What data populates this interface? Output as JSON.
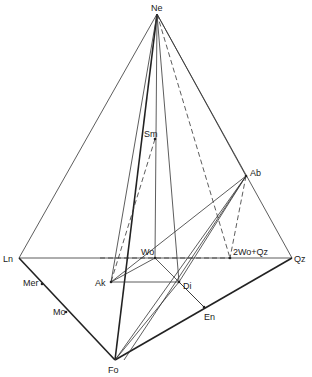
{
  "diagram": {
    "type": "tetrahedron-phase-diagram",
    "vertices": {
      "Ne": {
        "label": "Ne",
        "x": 157,
        "y": 14
      },
      "Ln": {
        "label": "Ln",
        "x": 19,
        "y": 258
      },
      "Qz": {
        "label": "Qz",
        "x": 292,
        "y": 258
      },
      "Fo": {
        "label": "Fo",
        "x": 115,
        "y": 360
      }
    },
    "points": {
      "Ab": {
        "label": "Ab",
        "x": 246,
        "y": 176
      },
      "Sm": {
        "label": "Sm",
        "x": 155,
        "y": 139
      },
      "Wo": {
        "label": "Wo",
        "x": 155,
        "y": 258
      },
      "WoQz": {
        "label": "2Wo+Qz",
        "x": 230,
        "y": 258
      },
      "Ak": {
        "label": "Ak",
        "x": 111,
        "y": 282
      },
      "Di": {
        "label": "Di",
        "x": 179,
        "y": 282
      },
      "En": {
        "label": "En",
        "x": 204,
        "y": 307
      },
      "Mer": {
        "label": "Mer",
        "x": 42,
        "y": 284
      },
      "Mo": {
        "label": "Mo",
        "x": 66,
        "y": 312
      }
    }
  }
}
